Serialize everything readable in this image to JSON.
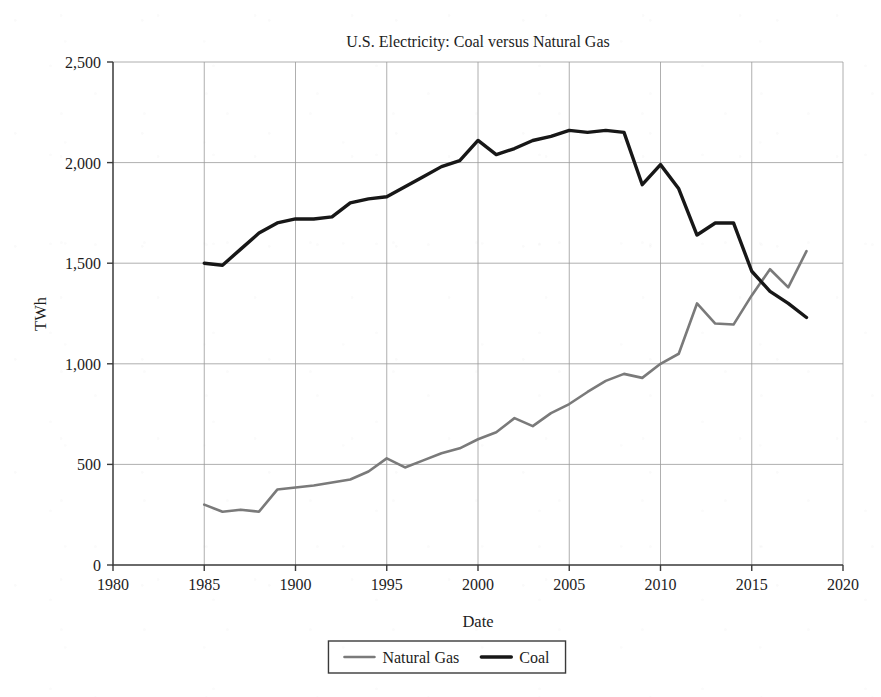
{
  "chart_data": {
    "type": "line",
    "title": "U.S. Electricity: Coal versus Natural Gas",
    "xlabel": "Date",
    "ylabel": "TWh",
    "xlim": [
      1980,
      2020
    ],
    "ylim": [
      0,
      2500
    ],
    "xticks": [
      1980,
      1985,
      1900,
      1995,
      2000,
      2005,
      2010,
      2015,
      2020
    ],
    "xtick_values": [
      1980,
      1985,
      1990,
      1995,
      2000,
      2005,
      2010,
      2015,
      2020
    ],
    "yticks": [
      0,
      500,
      1000,
      1500,
      2000,
      2500
    ],
    "ytick_labels": [
      "0",
      "500",
      "1,000",
      "1,500",
      "2,000",
      "2,500"
    ],
    "grid": true,
    "legend_position": "bottom",
    "x": [
      1985,
      1986,
      1987,
      1988,
      1989,
      1990,
      1991,
      1992,
      1993,
      1994,
      1995,
      1996,
      1997,
      1998,
      1999,
      2000,
      2001,
      2002,
      2003,
      2004,
      2005,
      2006,
      2007,
      2008,
      2009,
      2010,
      2011,
      2012,
      2013,
      2014,
      2015,
      2016,
      2017,
      2018
    ],
    "series": [
      {
        "name": "Natural Gas",
        "color": "#7a7a7a",
        "width": 2.6,
        "values": [
          300,
          265,
          275,
          265,
          375,
          385,
          395,
          410,
          425,
          465,
          530,
          485,
          520,
          555,
          580,
          625,
          660,
          730,
          690,
          755,
          800,
          860,
          915,
          950,
          930,
          1000,
          1050,
          1300,
          1200,
          1195,
          1340,
          1470,
          1380,
          1560
        ]
      },
      {
        "name": "Coal",
        "color": "#171717",
        "width": 3.4,
        "values": [
          1500,
          1490,
          1570,
          1650,
          1700,
          1720,
          1720,
          1730,
          1800,
          1820,
          1830,
          1880,
          1930,
          1980,
          2010,
          2110,
          2040,
          2070,
          2110,
          2130,
          2160,
          2150,
          2160,
          2150,
          1890,
          1990,
          1870,
          1640,
          1700,
          1700,
          1460,
          1360,
          1300,
          1230
        ]
      }
    ],
    "legend": [
      {
        "label": "Natural Gas",
        "color": "#7a7a7a",
        "width": 2.6
      },
      {
        "label": "Coal",
        "color": "#171717",
        "width": 3.4
      }
    ]
  },
  "layout": {
    "plot_left": 113,
    "plot_right": 843,
    "plot_top": 62,
    "plot_bottom": 565
  }
}
